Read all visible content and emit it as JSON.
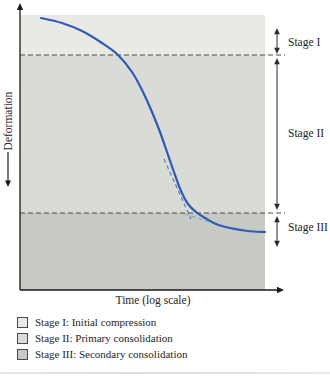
{
  "figure": {
    "ylabel": "Deformation",
    "xlabel": "Time (log scale)",
    "stage_labels": [
      "Stage I",
      "Stage II",
      "Stage III"
    ],
    "legend": [
      {
        "label": "Stage I: Initial compression",
        "color": "#e9eae5"
      },
      {
        "label": "Stage II: Primary consolidation",
        "color": "#d9dbd6"
      },
      {
        "label": "Stage III: Secondary consolidation",
        "color": "#c6c9c4"
      }
    ]
  },
  "chart_data": {
    "type": "line",
    "title": "",
    "xlabel": "Time (log scale)",
    "ylabel": "Deformation",
    "x_scale": "log",
    "y_axis_note": "deformation increases downward; schematic axes with no numeric ticks",
    "grid": false,
    "legend_position": "below chart, left-aligned",
    "stages": [
      {
        "name": "Stage I",
        "description": "Initial compression",
        "color": "#e9eae5"
      },
      {
        "name": "Stage II",
        "description": "Primary consolidation",
        "color": "#d9dbd6"
      },
      {
        "name": "Stage III",
        "description": "Secondary consolidation",
        "color": "#c6c9c4"
      }
    ],
    "geometry_px": {
      "canvas": [
        330,
        379
      ],
      "plot": {
        "left": 20,
        "right": 265,
        "top": 15,
        "bottom": 290
      },
      "band_boundaries_y": [
        15,
        55,
        213,
        290
      ],
      "guide_lines_y": [
        55,
        213
      ],
      "axis_color": "#1a1a1a",
      "guide_color": "#4d4d4d",
      "arrow_color": "#2b2b2b",
      "curve_color": "#2e5bb7",
      "curve_points": [
        [
          41,
          18
        ],
        [
          62,
          23
        ],
        [
          82,
          31
        ],
        [
          102,
          43
        ],
        [
          118,
          55
        ],
        [
          132,
          72
        ],
        [
          143,
          92
        ],
        [
          152,
          112
        ],
        [
          160,
          132
        ],
        [
          167,
          152
        ],
        [
          174,
          172
        ],
        [
          181,
          191
        ],
        [
          188,
          204
        ],
        [
          196,
          212
        ],
        [
          205,
          218
        ],
        [
          216,
          224
        ],
        [
          230,
          228
        ],
        [
          248,
          231
        ],
        [
          265,
          232
        ]
      ],
      "construction_lines": [
        {
          "from": [
            164,
            159
          ],
          "to": [
            191,
            219
          ],
          "color": "#5f7ab0"
        },
        {
          "from": [
            185,
            214
          ],
          "to": [
            222,
            226
          ],
          "color": "#8aa6cf"
        }
      ],
      "stage_arrow_x": 277,
      "stage_arrow_spans_y": [
        [
          28,
          54
        ],
        [
          58,
          210
        ],
        [
          216,
          247
        ]
      ],
      "ylabel_arrow": {
        "x": 8,
        "from_y": 152,
        "to_y": 187
      }
    }
  }
}
